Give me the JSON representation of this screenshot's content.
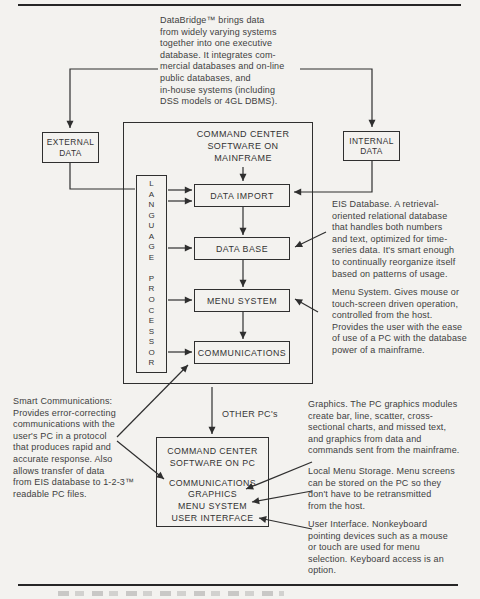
{
  "colors": {
    "ink": "#2f2f2f",
    "paper": "#f3f2ef"
  },
  "intro": {
    "text": "DataBridge™ brings data\nfrom widely varying systems\ntogether into one executive\ndatabase. It integrates com-\nmercial databases and on-line\npublic databases, and\nin-house systems (including\nDSS models or 4GL DBMS)."
  },
  "sources": {
    "external_label": "EXTERNAL\nDATA",
    "internal_label": "INTERNAL\nDATA"
  },
  "mainframe": {
    "title": "COMMAND CENTER\nSOFTWARE ON\nMAINFRAME",
    "language_processor_stacked": "L\nA\nN\nG\nU\nA\nG\nE\n\nP\nR\nO\nC\nE\nS\nS\nO\nR",
    "modules": [
      "DATA IMPORT",
      "DATA BASE",
      "MENU SYSTEM",
      "COMMUNICATIONS"
    ]
  },
  "pc": {
    "link_label": "OTHER PC's",
    "title": "COMMAND CENTER\nSOFTWARE ON PC",
    "modules": "COMMUNICATIONS\nGRAPHICS\nMENU SYSTEM\nUSER INTERFACE"
  },
  "annotations": {
    "smart_communications": "Smart Communications:\nProvides error-correcting\ncommunications with the\nuser's PC in a protocol\nthat produces rapid and\naccurate response. Also\nallows transfer of data\nfrom EIS database to 1-2-3™\nreadable PC files.",
    "eis_database": "EIS Database. A retrieval-\noriented relational database\nthat handles both numbers\nand text, optimized for time-\nseries data. It's smart enough\nto continually reorganize itself\nbased on patterns of usage.",
    "menu_system": "Menu System. Gives mouse or\ntouch-screen driven operation,\ncontrolled from the host.\nProvides the user with the ease\nof use of a PC with the database\npower of a mainframe.",
    "graphics": "Graphics. The PC graphics modules\ncreate bar, line, scatter, cross-\nsectional charts, and missed text,\nand graphics from data and\ncommands sent from the mainframe.",
    "local_menu_storage": "Local Menu Storage. Menu screens\ncan be stored on the PC so they\ndon't have to be retransmitted\nfrom the host.",
    "user_interface": "User Interface. Nonkeyboard\npointing devices such as a mouse\nor touch are used for menu\nselection. Keyboard access is an\noption."
  }
}
